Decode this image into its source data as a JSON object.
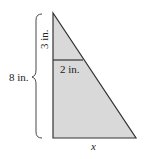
{
  "diagram": {
    "type": "similar-triangles",
    "labels": {
      "total_height": "8 in.",
      "small_height": "3 in.",
      "small_base": "2 in.",
      "large_base": "x"
    },
    "colors": {
      "fill": "#d9d9d9",
      "stroke": "#333333"
    }
  }
}
